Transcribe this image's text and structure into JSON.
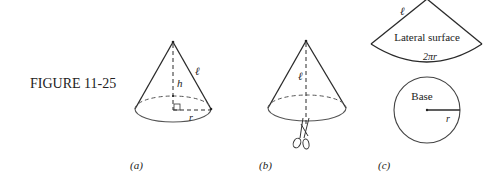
{
  "figure": {
    "label": "FIGURE 11-25"
  },
  "panels": [
    {
      "id": "a",
      "caption": "(a)",
      "labels": {
        "height": "h",
        "slant": "ℓ",
        "radius": "r"
      }
    },
    {
      "id": "b",
      "caption": "(b)",
      "labels": {
        "slant": "ℓ"
      },
      "icon": "scissors-icon"
    },
    {
      "id": "c",
      "caption": "(c)",
      "sector": {
        "title": "Lateral surface",
        "side": "ℓ",
        "arc": "2πr"
      },
      "circle": {
        "title": "Base",
        "radius": "r"
      }
    }
  ],
  "colors": {
    "line": "#2a2a2a",
    "text": "#222222",
    "background": "#ffffff"
  }
}
